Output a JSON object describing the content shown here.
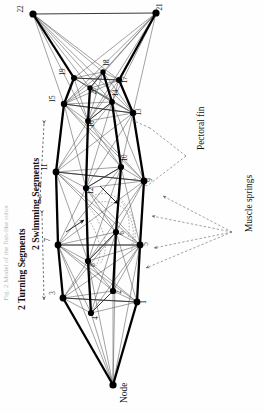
{
  "figure": {
    "type": "schematic-diagram",
    "orientation_deg": 90,
    "background_color": "#fefefe",
    "ink_color": "#111111",
    "node_color": "#000000",
    "thick_rail_color": "#000000",
    "thin_link_color": "#555555",
    "dashed_color": "#777777"
  },
  "annotations": {
    "pectoral_fin": "Pectoral fin",
    "muscle_springs": "Muscle springs",
    "node": "Node",
    "swimming_segments": "2 Swimming Segments",
    "turning_segments": "2 Turning Segments",
    "caption_fragment": "Fig. 2  Model of the fish-like robot"
  },
  "nodes": [
    {
      "id": "1",
      "x": 137,
      "y": 302,
      "r": 3.4,
      "label_dx": 7,
      "label_dy": 4
    },
    {
      "id": "2",
      "x": 113,
      "y": 291,
      "r": 3.1,
      "label_dx": 6,
      "label_dy": 5
    },
    {
      "id": "3",
      "x": 63,
      "y": 298,
      "r": 3.4,
      "label_dx": -10,
      "label_dy": -1
    },
    {
      "id": "4",
      "x": 91,
      "y": 313,
      "r": 3.1,
      "label_dx": 5,
      "label_dy": 9
    },
    {
      "id": "5",
      "x": 140,
      "y": 245,
      "r": 3.4,
      "label_dx": 6,
      "label_dy": 3
    },
    {
      "id": "6",
      "x": 116,
      "y": 232,
      "r": 3.1,
      "label_dx": 6,
      "label_dy": 5
    },
    {
      "id": "7",
      "x": 58,
      "y": 245,
      "r": 3.4,
      "label_dx": -10,
      "label_dy": -1
    },
    {
      "id": "8",
      "x": 88,
      "y": 261,
      "r": 3.1,
      "label_dx": 5,
      "label_dy": 8
    },
    {
      "id": "9",
      "x": 144,
      "y": 181,
      "r": 3.4,
      "label_dx": 6,
      "label_dy": 3
    },
    {
      "id": "10",
      "x": 121,
      "y": 167,
      "r": 3.1,
      "label_dx": 4,
      "label_dy": -5
    },
    {
      "id": "11",
      "x": 56,
      "y": 172,
      "r": 3.4,
      "label_dx": -11,
      "label_dy": -1
    },
    {
      "id": "12",
      "x": 86,
      "y": 188,
      "r": 3.1,
      "label_dx": 5,
      "label_dy": 7
    },
    {
      "id": "13",
      "x": 133,
      "y": 113,
      "r": 3.2,
      "label_dx": 6,
      "label_dy": 3
    },
    {
      "id": "14",
      "x": 112,
      "y": 102,
      "r": 2.9,
      "label_dx": 4,
      "label_dy": -5
    },
    {
      "id": "15",
      "x": 64,
      "y": 104,
      "r": 3.2,
      "label_dx": -11,
      "label_dy": -1
    },
    {
      "id": "16",
      "x": 88,
      "y": 121,
      "r": 2.9,
      "label_dx": 4,
      "label_dy": 7
    },
    {
      "id": "17",
      "x": 119,
      "y": 80,
      "r": 3.0,
      "label_dx": 6,
      "label_dy": 4
    },
    {
      "id": "18",
      "x": 103,
      "y": 72,
      "r": 2.7,
      "label_dx": 4,
      "label_dy": -5
    },
    {
      "id": "19",
      "x": 74,
      "y": 78,
      "r": 3.0,
      "label_dx": -11,
      "label_dy": -2
    },
    {
      "id": "20",
      "x": 90,
      "y": 88,
      "r": 2.7,
      "label_dx": 4,
      "label_dy": 7
    },
    {
      "id": "21",
      "x": 156,
      "y": 13,
      "r": 3.6,
      "label_dx": 4,
      "label_dy": -2
    },
    {
      "id": "22",
      "x": 33,
      "y": 14,
      "r": 3.6,
      "label_dx": -12,
      "label_dy": -1
    },
    {
      "id": "tail",
      "x": 113,
      "y": 385,
      "r": 3.6,
      "label_dx": 0,
      "label_dy": 0
    }
  ],
  "rails": {
    "left_outer": [
      [
        63,
        298
      ],
      [
        58,
        245
      ],
      [
        56,
        172
      ],
      [
        64,
        104
      ],
      [
        74,
        78
      ]
    ],
    "right_outer": [
      [
        137,
        302
      ],
      [
        140,
        245
      ],
      [
        144,
        181
      ],
      [
        133,
        113
      ],
      [
        119,
        80
      ]
    ],
    "left_inner": [
      [
        91,
        313
      ],
      [
        88,
        261
      ],
      [
        86,
        188
      ],
      [
        88,
        121
      ],
      [
        90,
        88
      ]
    ],
    "right_inner": [
      [
        113,
        291
      ],
      [
        116,
        232
      ],
      [
        121,
        167
      ],
      [
        112,
        102
      ],
      [
        103,
        72
      ]
    ]
  },
  "rungs": [
    [
      [
        63,
        298
      ],
      [
        137,
        302
      ]
    ],
    [
      [
        91,
        313
      ],
      [
        113,
        291
      ]
    ],
    [
      [
        58,
        245
      ],
      [
        140,
        245
      ]
    ],
    [
      [
        88,
        261
      ],
      [
        116,
        232
      ]
    ],
    [
      [
        56,
        172
      ],
      [
        144,
        181
      ]
    ],
    [
      [
        86,
        188
      ],
      [
        121,
        167
      ]
    ],
    [
      [
        64,
        104
      ],
      [
        133,
        113
      ]
    ],
    [
      [
        88,
        121
      ],
      [
        112,
        102
      ]
    ],
    [
      [
        74,
        78
      ],
      [
        119,
        80
      ]
    ],
    [
      [
        90,
        88
      ],
      [
        103,
        72
      ]
    ],
    [
      [
        33,
        14
      ],
      [
        156,
        13
      ]
    ]
  ],
  "leaders": {
    "pectoral_fin_label_pos": {
      "x": 196,
      "y": 150
    },
    "muscle_springs_label_pos": {
      "x": 244,
      "y": 232
    },
    "pectoral_fin_targets": [
      [
        150,
        128
      ],
      [
        147,
        186
      ]
    ],
    "muscle_springs_targets": [
      [
        163,
        196
      ],
      [
        152,
        216
      ],
      [
        154,
        248
      ],
      [
        146,
        268
      ]
    ]
  },
  "segment_brackets": {
    "swimming": {
      "label_x": 30,
      "label_y": 250,
      "from": [
        44,
        124
      ],
      "to": [
        40,
        200
      ]
    },
    "turning": {
      "label_x": 16,
      "label_y": 310,
      "from": [
        42,
        214
      ],
      "to": [
        44,
        300
      ]
    }
  },
  "legend_counts": {
    "total_nodes": 23,
    "numbered_nodes": 22,
    "segments": 4
  }
}
